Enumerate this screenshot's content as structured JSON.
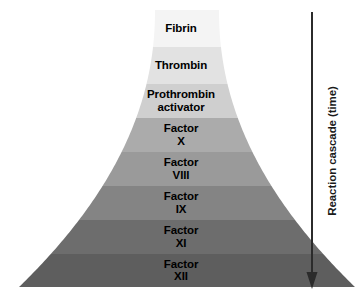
{
  "diagram": {
    "background_color": "#ffffff",
    "axis": {
      "label": "Reaction cascade (time)",
      "direction": "downward",
      "arrow_color": "#2b2b2b",
      "arrow_icon": "down-arrow-icon"
    },
    "bands": [
      {
        "label": "Fibrin",
        "color": "#f4f4f4",
        "top": 10,
        "bottom": 47,
        "half_width_top": 32,
        "half_width_bottom": 37
      },
      {
        "label": "Thrombin",
        "color": "#e2e2e2",
        "top": 47,
        "bottom": 84,
        "half_width_top": 37,
        "half_width_bottom": 47
      },
      {
        "label": "Prothrombin\nactivator",
        "color": "#cfcfcf",
        "top": 84,
        "bottom": 118,
        "half_width_top": 47,
        "half_width_bottom": 59
      },
      {
        "label": "Factor\nX",
        "color": "#ababab",
        "top": 118,
        "bottom": 152,
        "half_width_top": 59,
        "half_width_bottom": 74
      },
      {
        "label": "Factor\nVIII",
        "color": "#9a9a9a",
        "top": 152,
        "bottom": 186,
        "half_width_top": 74,
        "half_width_bottom": 94
      },
      {
        "label": "Factor\nIX",
        "color": "#848484",
        "top": 186,
        "bottom": 220,
        "half_width_top": 94,
        "half_width_bottom": 120
      },
      {
        "label": "Factor\nXI",
        "color": "#6d6d6d",
        "top": 220,
        "bottom": 254,
        "half_width_top": 120,
        "half_width_bottom": 152
      },
      {
        "label": "Factor\nXII",
        "color": "#5e5e5e",
        "top": 254,
        "bottom": 287,
        "half_width_top": 152,
        "half_width_bottom": 168
      }
    ]
  }
}
